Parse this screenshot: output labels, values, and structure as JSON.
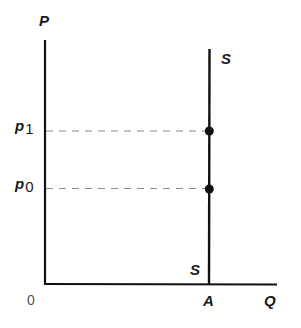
{
  "diagram": {
    "axes": {
      "y_label": "P",
      "x_label": "Q",
      "origin_label": "0"
    },
    "curve": {
      "name": "S",
      "label_top": "S",
      "label_bottom": "S",
      "quantity_label": "A"
    },
    "price_levels": [
      {
        "symbol": "p",
        "subscript": "1"
      },
      {
        "symbol": "p",
        "subscript": "0"
      }
    ],
    "colors": {
      "line": "#111111",
      "dashed": "#888888",
      "point": "#111111"
    }
  }
}
